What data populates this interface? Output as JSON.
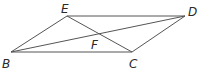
{
  "diagram": {
    "type": "geometry",
    "shape": "parallelogram",
    "points": {
      "E": {
        "x": 67,
        "y": 16,
        "label": "E",
        "lx": 61,
        "ly": 13
      },
      "D": {
        "x": 185,
        "y": 16,
        "label": "D",
        "lx": 188,
        "ly": 16
      },
      "B": {
        "x": 11,
        "y": 52,
        "label": "B",
        "lx": 2,
        "ly": 68
      },
      "C": {
        "x": 132,
        "y": 52,
        "label": "C",
        "lx": 129,
        "ly": 68
      },
      "F": {
        "x": 98,
        "y": 35,
        "label": "F",
        "lx": 91,
        "ly": 49
      }
    },
    "segments": [
      {
        "from": "B",
        "to": "E"
      },
      {
        "from": "E",
        "to": "D"
      },
      {
        "from": "D",
        "to": "C"
      },
      {
        "from": "C",
        "to": "B"
      },
      {
        "from": "B",
        "to": "D"
      },
      {
        "from": "E",
        "to": "C"
      }
    ],
    "line_color": "#555555",
    "label_color": "#2a2a2a"
  }
}
